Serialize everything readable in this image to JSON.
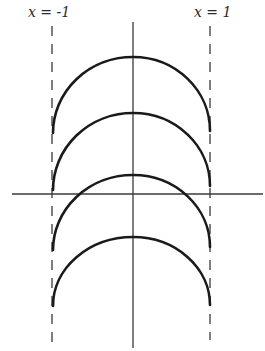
{
  "figure": {
    "labels": {
      "left_boundary": "x = -1",
      "right_boundary": "x = 1"
    },
    "colors": {
      "ink": "#1a1a1a",
      "axis": "#3a3a3a",
      "background": "#ffffff"
    },
    "axes": {
      "x_axis_y_px": 194,
      "x_axis_from_px": 12,
      "x_axis_to_px": 263,
      "y_axis_x_px": 133,
      "y_axis_from_px": 22,
      "y_axis_to_px": 348
    },
    "boundaries": [
      {
        "name": "x = -1",
        "x_px": 52,
        "from_px": 26,
        "to_px": 342
      },
      {
        "name": "x = 1",
        "x_px": 210,
        "from_px": 26,
        "to_px": 340
      }
    ],
    "arcs": [
      {
        "index": 1,
        "apex_y_px": 57,
        "left_end_y_px": 133,
        "right_end_y_px": 131
      },
      {
        "index": 2,
        "apex_y_px": 113,
        "left_end_y_px": 190,
        "right_end_y_px": 186
      },
      {
        "index": 3,
        "apex_y_px": 175,
        "left_end_y_px": 250,
        "right_end_y_px": 247
      },
      {
        "index": 4,
        "apex_y_px": 237,
        "left_end_y_px": 306,
        "right_end_y_px": 305
      }
    ]
  }
}
